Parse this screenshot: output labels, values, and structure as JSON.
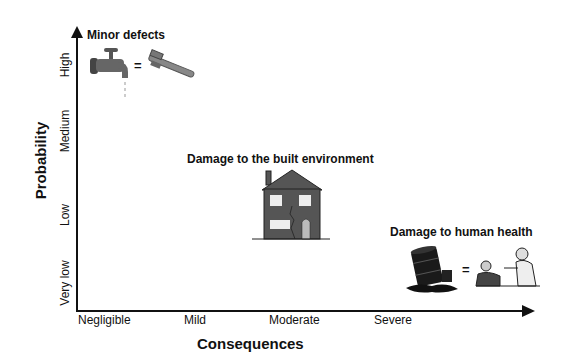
{
  "diagram": {
    "y_axis": {
      "title": "Probability",
      "ticks": [
        "Very low",
        "Low",
        "Medium",
        "High"
      ]
    },
    "x_axis": {
      "title": "Consequences",
      "ticks": [
        "Negligible",
        "Mild",
        "Moderate",
        "Severe"
      ]
    },
    "items": [
      {
        "label": "Minor defects",
        "icons": [
          "dripping-tap-icon",
          "equals-sign",
          "pipe-wrench-icon"
        ],
        "probability": "High",
        "consequence": "Negligible"
      },
      {
        "label": "Damage to the built environment",
        "icons": [
          "cracked-house-icon"
        ],
        "probability": "Low-Medium",
        "consequence": "Moderate"
      },
      {
        "label": "Damage to human health",
        "icons": [
          "spilled-barrel-icon",
          "equals-sign",
          "sick-patient-icon"
        ],
        "probability": "Very low",
        "consequence": "Severe"
      }
    ],
    "equals": "="
  }
}
